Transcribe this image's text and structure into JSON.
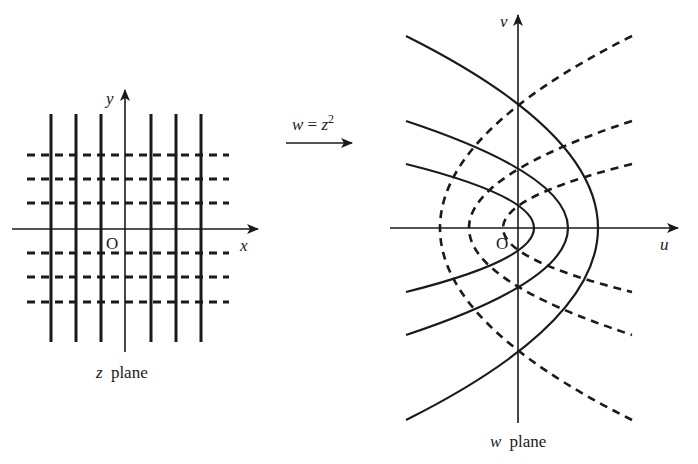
{
  "z_plane": {
    "caption_var": "z",
    "caption_word": "plane",
    "x_axis_label": "x",
    "y_axis_label": "y",
    "origin_label": "O",
    "solid_vertical_lines_x": [
      51,
      76,
      101,
      151,
      176,
      201
    ],
    "dashed_horizontal_lines_y": [
      155,
      179,
      203,
      253,
      277,
      302
    ]
  },
  "mapping": {
    "label_lhs": "w",
    "label_eq": " = ",
    "label_base": "z",
    "label_exp": "2"
  },
  "w_plane": {
    "caption_var": "w",
    "caption_word": "plane",
    "u_axis_label": "u",
    "v_axis_label": "v",
    "origin_label": "O",
    "solid_parabolas": [
      {
        "vertex_u": 534,
        "end_u": 406,
        "half_span": 64
      },
      {
        "vertex_u": 568,
        "end_u": 406,
        "half_span": 107
      },
      {
        "vertex_u": 598,
        "end_u": 406,
        "half_span": 192
      }
    ],
    "dashed_parabolas": [
      {
        "vertex_u": 503,
        "end_u": 632,
        "half_span": 64
      },
      {
        "vertex_u": 469,
        "end_u": 632,
        "half_span": 107
      },
      {
        "vertex_u": 440,
        "end_u": 632,
        "half_span": 192
      }
    ]
  },
  "colors": {
    "ink": "#1a1a1a",
    "background": "#ffffff"
  }
}
